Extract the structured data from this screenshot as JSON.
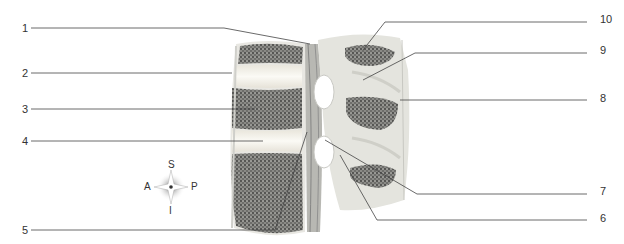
{
  "diagram": {
    "type": "anatomical-illustration",
    "labels_left": [
      {
        "id": "1",
        "text": "1"
      },
      {
        "id": "2",
        "text": "2"
      },
      {
        "id": "3",
        "text": "3"
      },
      {
        "id": "4",
        "text": "4"
      },
      {
        "id": "5",
        "text": "5"
      }
    ],
    "labels_right": [
      {
        "id": "10",
        "text": "10"
      },
      {
        "id": "9",
        "text": "9"
      },
      {
        "id": "8",
        "text": "8"
      },
      {
        "id": "7",
        "text": "7"
      },
      {
        "id": "6",
        "text": "6"
      }
    ],
    "compass": {
      "superior": "S",
      "inferior": "I",
      "anterior": "A",
      "posterior": "P"
    }
  },
  "colors": {
    "leader_line": "#444444",
    "bone_texture": "#5a5a5a",
    "disc": "#ece8df",
    "soft_tissue": "#e2e2dc",
    "canal": "#b9b9b4"
  }
}
